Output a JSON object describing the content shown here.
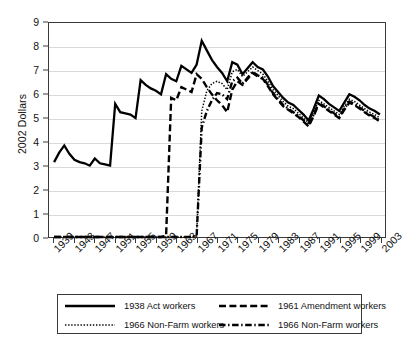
{
  "chart_data": {
    "type": "line",
    "title": "",
    "xlabel": "",
    "ylabel": "2002 Dollars",
    "xlim": [
      1938,
      2004
    ],
    "ylim": [
      0,
      9
    ],
    "yticks": [
      0,
      1,
      2,
      3,
      4,
      5,
      6,
      7,
      8,
      9
    ],
    "xticks": [
      1939,
      1943,
      1947,
      1951,
      1955,
      1959,
      1963,
      1967,
      1971,
      1975,
      1979,
      1983,
      1987,
      1991,
      1995,
      1999,
      2003
    ],
    "grid": "horizontal",
    "legend_position": "below-axes",
    "x": [
      1939,
      1940,
      1941,
      1942,
      1943,
      1944,
      1945,
      1946,
      1947,
      1948,
      1949,
      1950,
      1951,
      1952,
      1953,
      1954,
      1955,
      1956,
      1957,
      1958,
      1959,
      1960,
      1961,
      1962,
      1963,
      1964,
      1965,
      1966,
      1967,
      1968,
      1969,
      1970,
      1971,
      1972,
      1973,
      1974,
      1975,
      1976,
      1977,
      1978,
      1979,
      1980,
      1981,
      1982,
      1983,
      1984,
      1985,
      1986,
      1987,
      1988,
      1989,
      1990,
      1991,
      1992,
      1993,
      1994,
      1995,
      1996,
      1997,
      1998,
      1999,
      2000,
      2001,
      2002,
      2003
    ],
    "series": [
      {
        "name": "1938 Act workers",
        "style": "solid",
        "values": [
          3.15,
          3.55,
          3.85,
          3.5,
          3.25,
          3.15,
          3.1,
          3.0,
          3.3,
          3.1,
          3.05,
          3.0,
          5.6,
          5.25,
          5.2,
          5.15,
          5.0,
          6.6,
          6.4,
          6.25,
          6.15,
          6.0,
          6.85,
          6.65,
          6.55,
          7.2,
          7.05,
          6.9,
          7.25,
          8.25,
          7.85,
          7.45,
          7.15,
          6.9,
          6.55,
          7.35,
          7.25,
          6.85,
          7.1,
          7.35,
          7.15,
          7.05,
          6.75,
          6.35,
          6.1,
          5.85,
          5.65,
          5.55,
          5.35,
          5.15,
          4.9,
          5.4,
          5.95,
          5.8,
          5.6,
          5.45,
          5.3,
          5.65,
          6.0,
          5.9,
          5.75,
          5.55,
          5.4,
          5.3,
          5.15
        ]
      },
      {
        "name": "1961 Amendment workers",
        "style": "dashed",
        "values": [
          0,
          0,
          0,
          0,
          0,
          0,
          0,
          0,
          0,
          0,
          0,
          0,
          0,
          0,
          0,
          0,
          0,
          0,
          0,
          0,
          0,
          0,
          0.05,
          5.85,
          5.75,
          6.3,
          6.2,
          6.1,
          6.85,
          6.65,
          6.3,
          6.0,
          5.75,
          5.55,
          5.25,
          6.2,
          6.55,
          6.4,
          6.65,
          6.9,
          6.75,
          6.65,
          6.35,
          6.0,
          5.75,
          5.5,
          5.35,
          5.2,
          5.05,
          4.85,
          4.65,
          5.1,
          5.6,
          5.45,
          5.3,
          5.15,
          5.0,
          5.35,
          5.65,
          5.55,
          5.4,
          5.25,
          5.1,
          5.0,
          4.85
        ]
      },
      {
        "name": "1966 Non-Farm workers",
        "style": "dotted",
        "values": [
          0,
          0,
          0,
          0,
          0,
          0,
          0,
          0,
          0,
          0,
          0,
          0,
          0,
          0,
          0,
          0,
          0,
          0,
          0,
          0,
          0,
          0,
          0,
          0,
          0,
          0,
          0,
          0,
          0.05,
          5.3,
          6.15,
          6.45,
          6.55,
          6.45,
          6.2,
          6.95,
          7.05,
          6.75,
          6.95,
          7.15,
          7.0,
          6.85,
          6.55,
          6.2,
          5.95,
          5.7,
          5.5,
          5.4,
          5.2,
          5.0,
          4.8,
          5.25,
          5.75,
          5.6,
          5.45,
          5.3,
          5.15,
          5.5,
          5.8,
          5.7,
          5.55,
          5.4,
          5.25,
          5.15,
          5.0
        ]
      },
      {
        "name": "1966 Non-Farm workers",
        "style": "dashdot",
        "values": [
          0,
          0,
          0,
          0,
          0,
          0,
          0,
          0,
          0,
          0,
          0,
          0,
          0,
          0,
          0,
          0,
          0,
          0,
          0,
          0,
          0,
          0,
          0,
          0,
          0,
          0,
          0,
          0,
          0.05,
          4.6,
          5.3,
          5.75,
          6.05,
          6.0,
          5.8,
          6.55,
          6.7,
          6.45,
          6.7,
          6.95,
          6.8,
          6.7,
          6.4,
          6.05,
          5.8,
          5.55,
          5.4,
          5.25,
          5.1,
          4.9,
          4.7,
          5.15,
          5.65,
          5.5,
          5.35,
          5.2,
          5.05,
          5.4,
          5.7,
          5.6,
          5.45,
          5.3,
          5.15,
          5.05,
          4.9
        ]
      }
    ],
    "legend_entries": [
      {
        "label": "1938 Act workers",
        "style": "solid"
      },
      {
        "label": "1961 Amendment workers",
        "style": "dashed"
      },
      {
        "label": "1966 Non-Farm workers",
        "style": "dotted"
      },
      {
        "label": "1966 Non-Farm workers",
        "style": "dashdot"
      }
    ]
  }
}
